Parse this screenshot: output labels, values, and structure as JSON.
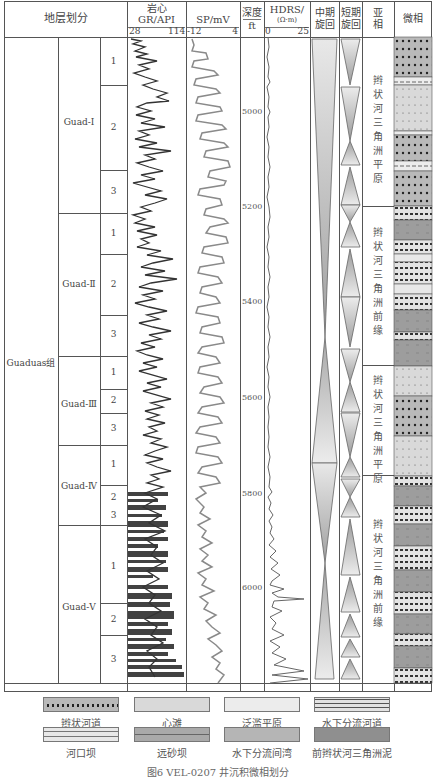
{
  "header": {
    "strat_division": "地层划分",
    "gr_title": "岩心",
    "gr_unit": "GR/API",
    "gr_min": "28",
    "gr_max": "114",
    "sp_unit": "SP/mV",
    "sp_min": "-12",
    "sp_max": "4",
    "depth_title": "深度",
    "depth_unit": "ft",
    "hdrs_unit": "HDRS/",
    "hdrs_sub": "(Ω·m)",
    "hdrs_min": "0",
    "hdrs_max": "25",
    "mid_cycle": "中期旋回",
    "mid_cycle_1": "中期",
    "mid_cycle_2": "旋回",
    "short_cycle_1": "短期",
    "short_cycle_2": "旋回",
    "subfacies_1": "亚",
    "subfacies_2": "相",
    "microfacies": "微相"
  },
  "formation": "Guaduas组",
  "members": [
    {
      "name": "Guad-Ⅰ",
      "layers": [
        "1",
        "2",
        "3"
      ]
    },
    {
      "name": "Guad-Ⅱ",
      "layers": [
        "1",
        "2",
        "3"
      ]
    },
    {
      "name": "Guad-Ⅲ",
      "layers": [
        "1",
        "2",
        "3"
      ]
    },
    {
      "name": "Guad-Ⅳ",
      "layers": [
        "1",
        "2",
        "3"
      ]
    },
    {
      "name": "Guad-Ⅴ",
      "layers": [
        "1",
        "2",
        "3"
      ]
    }
  ],
  "depth_ticks": [
    "5000",
    "5200",
    "5400",
    "5600",
    "5800",
    "6000"
  ],
  "subfacies": [
    "辫状河三角洲平原",
    "辫状河三角洲前缘",
    "辫状河三角洲平原",
    "辫状河三角洲前缘"
  ],
  "legend": [
    {
      "label": "辫状河道",
      "color": "#b9b9b9"
    },
    {
      "label": "心滩",
      "color": "#d9d9d9"
    },
    {
      "label": "泛滥平原",
      "color": "#ececec"
    },
    {
      "label": "水下分流河道",
      "color": "#e3e3e3"
    },
    {
      "label": "河口坝",
      "color": "#e8e8e8"
    },
    {
      "label": "远砂坝",
      "color": "#a9a9a9"
    },
    {
      "label": "水下分流间湾",
      "color": "#b5b5b5"
    },
    {
      "label": "前辫状河三角洲泥",
      "color": "#8f8f8f"
    }
  ],
  "caption": "图6  VEL-0207 井沉积微相划分"
}
